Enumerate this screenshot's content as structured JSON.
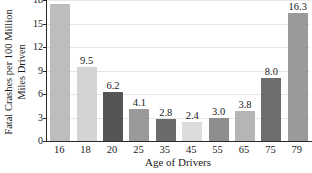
{
  "chart_data": {
    "type": "bar",
    "title": "",
    "xlabel": "Age of Drivers",
    "ylabel": "Fatal Crashes per 100 Million Miles Driven",
    "ylabel_lines": [
      "Fatal Crashes per 100 Million",
      "Miles Driven"
    ],
    "categories": [
      "16",
      "18",
      "20",
      "25",
      "35",
      "45",
      "55",
      "65",
      "75",
      "79"
    ],
    "values": [
      17.5,
      9.5,
      6.2,
      4.1,
      2.8,
      2.4,
      3.0,
      3.8,
      8.0,
      16.3
    ],
    "data_labels": [
      "",
      "9.5",
      "6.2",
      "4.1",
      "2.8",
      "2.4",
      "3.0",
      "3.8",
      "8.0",
      "16.3"
    ],
    "bar_colors": [
      "#bdbdbd",
      "#d4d4d4",
      "#555555",
      "#9a9a9a",
      "#6b6b6b",
      "#dcdcdc",
      "#8e8e8e",
      "#b5b5b5",
      "#6e6e6e",
      "#9a9a9a"
    ],
    "yticks": [
      "0",
      "3",
      "6",
      "9",
      "12",
      "15",
      "18"
    ],
    "ytick_values": [
      0,
      3,
      6,
      9,
      12,
      15,
      18
    ],
    "ylim": [
      0,
      18
    ],
    "xlim_note": "categorical",
    "grid": true,
    "grid_color": "#e6e6e6",
    "legend": "none",
    "axis_color": "#2a2a2a",
    "background": "#ffffff"
  }
}
